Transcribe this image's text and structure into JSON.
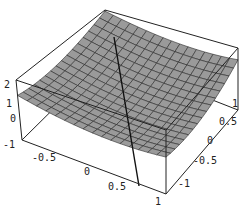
{
  "chart_data": {
    "type": "surface3d",
    "title": "",
    "xlabel": "",
    "ylabel": "",
    "zlabel": "",
    "x_ticks": [
      "-0.5",
      "0",
      "0.5",
      "1"
    ],
    "y_ticks": [
      "-1",
      "-0.5",
      "0",
      "0.5",
      "1"
    ],
    "z_ticks": [
      "-1",
      "0",
      "1",
      "2"
    ],
    "xlim": [
      -1,
      1
    ],
    "ylim": [
      -1,
      1
    ],
    "zlim": [
      -1,
      2
    ],
    "surface": "saddle-like sheet, higher at back and at right edge, grid 16x16",
    "line": {
      "description": "straight line piercing the surface",
      "from_px": [
        114,
        37
      ],
      "to_px": [
        139,
        186
      ]
    },
    "colors": {
      "surface": "#9a9a9a",
      "mesh": "#2a2a2a",
      "box": "#222222",
      "background": "#ffffff"
    }
  },
  "labels": {
    "z": [
      {
        "text": "2",
        "x": 4,
        "y": 88
      },
      {
        "text": "1",
        "x": 6,
        "y": 107
      },
      {
        "text": "0",
        "x": 10,
        "y": 122
      },
      {
        "text": "-1",
        "x": 3,
        "y": 148
      }
    ],
    "x": [
      {
        "text": "-0.5",
        "x": 32,
        "y": 161
      },
      {
        "text": "0",
        "x": 84,
        "y": 175
      },
      {
        "text": "0.5",
        "x": 108,
        "y": 190
      },
      {
        "text": "1",
        "x": 155,
        "y": 205
      }
    ],
    "y": [
      {
        "text": "1",
        "x": 232,
        "y": 107
      },
      {
        "text": "0.5",
        "x": 219,
        "y": 125
      },
      {
        "text": "0",
        "x": 207,
        "y": 144
      },
      {
        "text": "-0.5",
        "x": 193,
        "y": 164
      },
      {
        "text": "-1",
        "x": 178,
        "y": 187
      }
    ]
  }
}
